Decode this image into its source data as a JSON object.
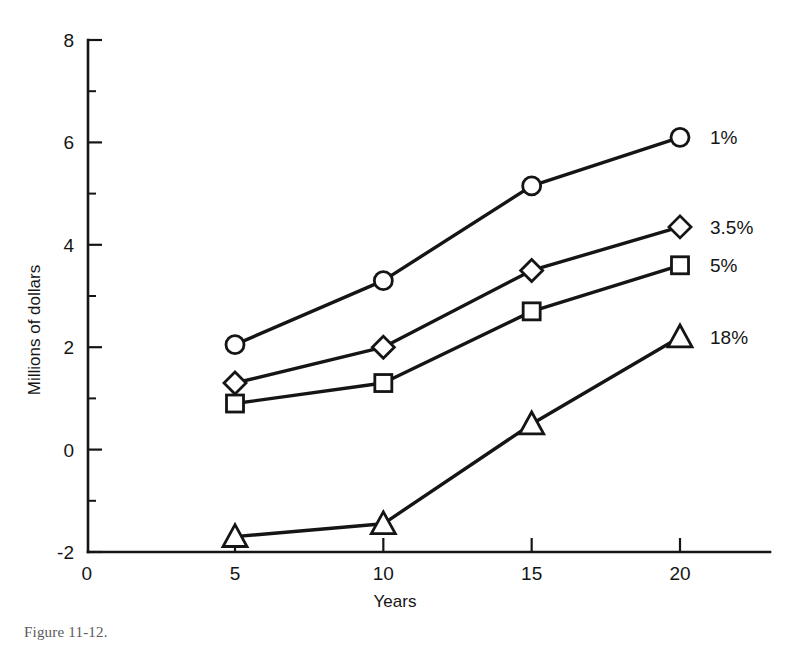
{
  "figure": {
    "caption": "Figure 11-12."
  },
  "chart_data": {
    "type": "line",
    "title": "",
    "xlabel": "Years",
    "ylabel": "Millions of dollars",
    "x": [
      5,
      10,
      15,
      20
    ],
    "xlim": [
      0,
      23
    ],
    "ylim": [
      -2,
      8
    ],
    "xticks": [
      0,
      5,
      10,
      15,
      20
    ],
    "xtick_labels": [
      "0",
      "5",
      "10",
      "15",
      "20"
    ],
    "yticks": [
      -2,
      0,
      2,
      4,
      6,
      8
    ],
    "ytick_labels": [
      "-2",
      "0",
      "2",
      "4",
      "6",
      "8"
    ],
    "y_minor_ticks": [
      -1,
      1,
      3,
      5,
      7
    ],
    "grid": false,
    "legend_position": "right-of-line-ends",
    "series": [
      {
        "name": "1%",
        "marker": "circle",
        "values": [
          2.05,
          3.3,
          5.15,
          6.1
        ],
        "label": "1%"
      },
      {
        "name": "3.5%",
        "marker": "diamond",
        "values": [
          1.3,
          2.0,
          3.5,
          4.35
        ],
        "label": "3.5%"
      },
      {
        "name": "5%",
        "marker": "square",
        "values": [
          0.9,
          1.3,
          2.7,
          3.6
        ],
        "label": "5%"
      },
      {
        "name": "18%",
        "marker": "triangle",
        "values": [
          -1.7,
          -1.45,
          0.5,
          2.2
        ],
        "label": "18%"
      }
    ]
  },
  "colors": {
    "ink": "#151515",
    "background": "#ffffff",
    "marker_fill": "#ffffff"
  }
}
